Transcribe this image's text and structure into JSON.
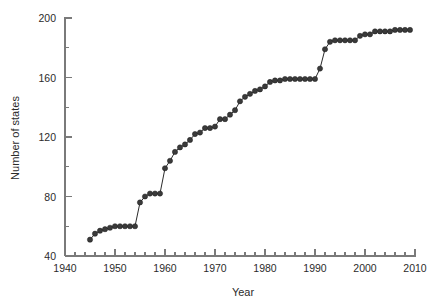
{
  "chart_data": {
    "type": "line",
    "title": "",
    "subtitle": "",
    "xlabel": "Year",
    "ylabel": "Number of states",
    "xlim": [
      1940,
      2010
    ],
    "ylim": [
      40,
      200
    ],
    "x_major_ticks": [
      1940,
      1950,
      1960,
      1970,
      1980,
      1990,
      2000,
      2010
    ],
    "x_major_tick_labels": [
      "1940",
      "1950",
      "1960",
      "1970",
      "1980",
      "1990",
      "2000",
      "2010"
    ],
    "x_minor_tick_step": 2,
    "y_major_ticks": [
      40,
      80,
      120,
      160,
      200
    ],
    "y_major_tick_labels": [
      "40",
      "80",
      "120",
      "160",
      "200"
    ],
    "y_minor_ticks": [
      60,
      100,
      140,
      180
    ],
    "grid": false,
    "legend": false,
    "legend_position": "none",
    "marker": "filled-circle",
    "marker_size": 2.6,
    "line_color": "#2b2b2b",
    "marker_color": "#3a3a3a",
    "axis_color": "#7a7a7a",
    "background_color": "#ffffff",
    "x": [
      1945,
      1946,
      1947,
      1948,
      1949,
      1950,
      1951,
      1952,
      1953,
      1954,
      1955,
      1956,
      1957,
      1958,
      1959,
      1960,
      1961,
      1962,
      1963,
      1964,
      1965,
      1966,
      1967,
      1968,
      1969,
      1970,
      1971,
      1972,
      1973,
      1974,
      1975,
      1976,
      1977,
      1978,
      1979,
      1980,
      1981,
      1982,
      1983,
      1984,
      1985,
      1986,
      1987,
      1988,
      1989,
      1990,
      1991,
      1992,
      1993,
      1994,
      1995,
      1996,
      1997,
      1998,
      1999,
      2000,
      2001,
      2002,
      2003,
      2004,
      2005,
      2006,
      2007,
      2008,
      2009
    ],
    "y": [
      51,
      55,
      57,
      58,
      59,
      60,
      60,
      60,
      60,
      60,
      76,
      80,
      82,
      82,
      82,
      99,
      104,
      110,
      113,
      115,
      118,
      122,
      123,
      126,
      126,
      127,
      132,
      132,
      135,
      138,
      144,
      147,
      149,
      151,
      152,
      154,
      157,
      158,
      158,
      159,
      159,
      159,
      159,
      159,
      159,
      159,
      166,
      179,
      184,
      185,
      185,
      185,
      185,
      185,
      188,
      189,
      189,
      191,
      191,
      191,
      191,
      192,
      192,
      192,
      192
    ],
    "series": [
      {
        "name": "Number of states",
        "values": [
          51,
          55,
          57,
          58,
          59,
          60,
          60,
          60,
          60,
          60,
          76,
          80,
          82,
          82,
          82,
          99,
          104,
          110,
          113,
          115,
          118,
          122,
          123,
          126,
          126,
          127,
          132,
          132,
          135,
          138,
          144,
          147,
          149,
          151,
          152,
          154,
          157,
          158,
          158,
          159,
          159,
          159,
          159,
          159,
          159,
          159,
          166,
          179,
          184,
          185,
          185,
          185,
          185,
          185,
          188,
          189,
          189,
          191,
          191,
          191,
          191,
          192,
          192,
          192,
          192
        ]
      }
    ],
    "annotations": []
  }
}
